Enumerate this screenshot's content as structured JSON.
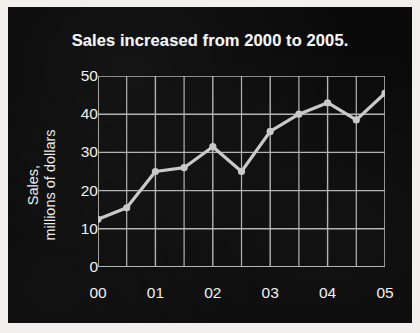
{
  "figure": {
    "background_color": "#0a0a0a",
    "paper_color": "#f2f0ec",
    "foreground_color": "#f0f0f0",
    "grid_color": "#b4b4b4",
    "series_color": "#c9c9c9"
  },
  "chart_data": {
    "type": "line",
    "title": "Sales increased from 2000 to 2005.",
    "xlabel": "",
    "ylabel_line1": "Sales,",
    "ylabel_line2": "millions of dollars",
    "ylabel": "Sales, millions of dollars",
    "xlim": [
      0,
      5
    ],
    "ylim": [
      0,
      50
    ],
    "yticks": [
      0,
      10,
      20,
      30,
      40,
      50
    ],
    "ytick_labels": [
      "0",
      "10",
      "20",
      "30",
      "40",
      "50"
    ],
    "xticks": [
      0,
      1,
      2,
      3,
      4,
      5
    ],
    "xtick_labels": [
      "00",
      "01",
      "02",
      "03",
      "04",
      "05"
    ],
    "x_minor_ticks": [
      0.5,
      1.5,
      2.5,
      3.5,
      4.5
    ],
    "grid": true,
    "grid_minor_x": true,
    "legend": false,
    "marker": "circle",
    "x": [
      0,
      0.5,
      1,
      1.5,
      2,
      2.5,
      3,
      3.5,
      4,
      4.5,
      5
    ],
    "x_point_labels": [
      "00",
      "00.5",
      "01",
      "01.5",
      "02",
      "02.5",
      "03",
      "03.5",
      "04",
      "04.5",
      "05"
    ],
    "values": [
      12.5,
      15.5,
      25,
      26,
      31.5,
      25,
      35.5,
      40,
      43,
      38.5,
      45.5
    ],
    "series": [
      {
        "name": "Sales",
        "values": [
          12.5,
          15.5,
          25,
          26,
          31.5,
          25,
          35.5,
          40,
          43,
          38.5,
          45.5
        ]
      }
    ]
  }
}
